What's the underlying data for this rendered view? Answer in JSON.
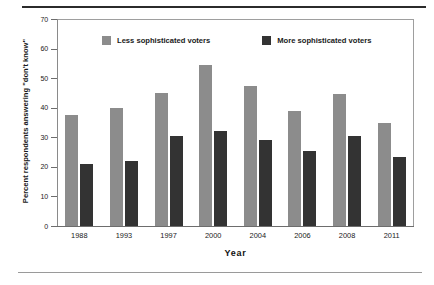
{
  "chart_data": {
    "type": "bar",
    "title": "",
    "subtitle": "",
    "xlabel": "Year",
    "ylabel": "Percent respondents answering \"don't know\"",
    "categories": [
      "1988",
      "1993",
      "1997",
      "2000",
      "2004",
      "2006",
      "2008",
      "2011"
    ],
    "series": [
      {
        "name": "Less sophisticated voters",
        "color": "#8c8c8c",
        "values": [
          37.5,
          40.0,
          45.0,
          54.5,
          47.5,
          39.0,
          44.5,
          35.0
        ]
      },
      {
        "name": "More sophisticated voters",
        "color": "#333333",
        "values": [
          21.0,
          22.0,
          30.5,
          32.0,
          29.0,
          25.5,
          30.5,
          23.5
        ]
      }
    ],
    "ylim": [
      0,
      70
    ],
    "yticks": [
      0,
      10,
      20,
      30,
      40,
      50,
      60,
      70
    ],
    "ytick_labels": [
      "0",
      "10",
      "20",
      "30",
      "40",
      "50",
      "60",
      "70"
    ],
    "grid": false,
    "legend_position": "top-inside",
    "legend": [
      {
        "label": "Less sophisticated voters",
        "swatch": "#8c8c8c"
      },
      {
        "label": "More sophisticated voters",
        "swatch": "#333333"
      }
    ]
  },
  "figure": {
    "rule_top_color": "#2b2b2b",
    "rule_bottom_color": "#9a9a9a",
    "plot_border_color": "#9e9e9e",
    "background": "#ffffff"
  }
}
